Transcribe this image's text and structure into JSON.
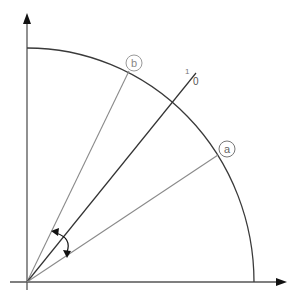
{
  "diagram": {
    "type": "polar-angle-diagram",
    "axes": {
      "x_axis": "horizontal-axis",
      "y_axis": "vertical-axis"
    },
    "arc": "quarter-circle-arc",
    "markers": [
      {
        "id": "a",
        "label": "a"
      },
      {
        "id": "b",
        "label": "b"
      }
    ],
    "reference_line": {
      "label_top": "1",
      "label_bottom": "0"
    },
    "angle_indicator": "double-headed-curved-arrow",
    "colors": {
      "axis": "#3a3a3a",
      "arc": "#3a3a3a",
      "ray_a": "#7a7a7a",
      "ray_b": "#7a7a7a",
      "ray_ref": "#333333",
      "marker_stroke": "#8a8a8a",
      "marker_text": "#777777"
    }
  }
}
